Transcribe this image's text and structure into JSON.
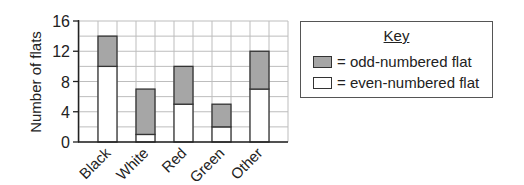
{
  "chart_data": {
    "type": "bar",
    "stacked": true,
    "title": "",
    "xlabel": "",
    "ylabel": "Number of flats",
    "ylim": [
      0,
      16
    ],
    "yticks": [
      0,
      4,
      8,
      12,
      16
    ],
    "grid": true,
    "categories": [
      "Black",
      "White",
      "Red",
      "Green",
      "Other"
    ],
    "series": [
      {
        "name": "even-numbered flat",
        "color": "#ffffff",
        "values": [
          10,
          1,
          5,
          2,
          7
        ]
      },
      {
        "name": "odd-numbered flat",
        "color": "#a6a6a6",
        "values": [
          4,
          6,
          5,
          3,
          5
        ]
      }
    ],
    "totals": [
      14,
      7,
      10,
      5,
      12
    ],
    "legend": {
      "position": "right",
      "title": "Key",
      "entries": [
        {
          "label": "= odd-numbered flat",
          "color": "#a6a6a6"
        },
        {
          "label": "= even-numbered flat",
          "color": "#ffffff"
        }
      ]
    }
  }
}
